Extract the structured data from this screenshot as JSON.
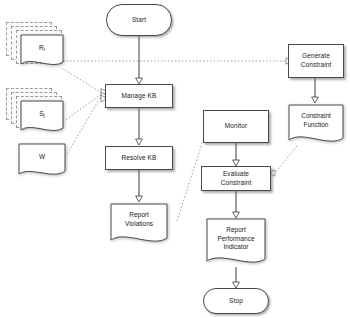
{
  "diagram": {
    "colors": {
      "node_fill": "#ffffff",
      "node_stroke": "#4a4a4a",
      "solid_edge": "#3d3d3d",
      "dotted_edge": "#8a8a8a",
      "ghost_stroke": "#9a9a9a"
    },
    "nodes": {
      "start": {
        "label": "Start",
        "shape": "terminator"
      },
      "manage_kb": {
        "label": "Manage KB",
        "shape": "process"
      },
      "resolve_kb": {
        "label": "Resolve KB",
        "shape": "process"
      },
      "report_violations": {
        "label_line1": "Report",
        "label_line2": "Violations",
        "shape": "document"
      },
      "generate_constraint": {
        "label_line1": "Generate",
        "label_line2": "Constraint",
        "shape": "process"
      },
      "constraint_function": {
        "label_line1": "Constraint",
        "label_line2": "Function",
        "shape": "document"
      },
      "monitor": {
        "label": "Monitor",
        "shape": "process"
      },
      "evaluate_constraint": {
        "label_line1": "Evaluate",
        "label_line2": "Constraint",
        "shape": "process"
      },
      "report_performance_indicator": {
        "label_line1": "Report",
        "label_line2": "Performance",
        "label_line3": "Indicator",
        "shape": "document"
      },
      "stop": {
        "label": "Stop",
        "shape": "terminator"
      },
      "rules_stack": {
        "label_base": "R",
        "label_sub": "i",
        "shape": "multi-document"
      },
      "states_stack": {
        "label_base": "S",
        "label_sub": "j",
        "shape": "multi-document"
      },
      "weights_doc": {
        "label": "W",
        "shape": "document"
      }
    },
    "edges": [
      {
        "from": "start",
        "to": "manage_kb",
        "style": "solid"
      },
      {
        "from": "manage_kb",
        "to": "resolve_kb",
        "style": "solid"
      },
      {
        "from": "resolve_kb",
        "to": "report_violations",
        "style": "solid"
      },
      {
        "from": "rules_stack",
        "to": "generate_constraint",
        "style": "dotted"
      },
      {
        "from": "rules_stack",
        "to": "manage_kb",
        "style": "dotted"
      },
      {
        "from": "states_stack",
        "to": "manage_kb",
        "style": "dotted"
      },
      {
        "from": "weights_doc",
        "to": "manage_kb",
        "style": "dotted"
      },
      {
        "from": "generate_constraint",
        "to": "constraint_function",
        "style": "solid"
      },
      {
        "from": "constraint_function",
        "to": "evaluate_constraint",
        "style": "dotted"
      },
      {
        "from": "report_violations",
        "to": "monitor",
        "style": "dotted"
      },
      {
        "from": "monitor",
        "to": "evaluate_constraint",
        "style": "solid"
      },
      {
        "from": "evaluate_constraint",
        "to": "report_performance_indicator",
        "style": "solid"
      },
      {
        "from": "report_performance_indicator",
        "to": "stop",
        "style": "solid"
      }
    ]
  }
}
